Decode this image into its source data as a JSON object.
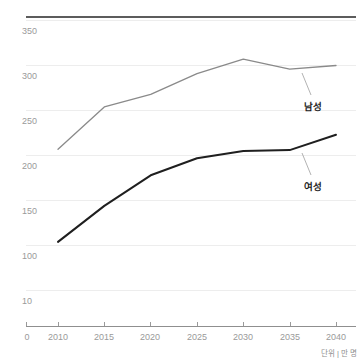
{
  "chart_data": {
    "type": "line",
    "title": "",
    "subtitle": "",
    "xlabel": "",
    "ylabel": "",
    "unit_note": "단위 | 만 명",
    "x": [
      2010,
      2015,
      2020,
      2025,
      2030,
      2035,
      2040
    ],
    "x_tick_labels": [
      "2010",
      "2015",
      "2020",
      "2025",
      "2030",
      "2035",
      "2040"
    ],
    "x_origin_label": "0",
    "y_tick_labels": [
      "10",
      "100",
      "150",
      "200",
      "250",
      "300",
      "350"
    ],
    "y_tick_values": [
      50,
      100,
      150,
      200,
      250,
      300,
      350
    ],
    "ylim": [
      0,
      375
    ],
    "xlim": [
      2006,
      2043
    ],
    "grid": true,
    "legend_position": "inline-annotation",
    "series": [
      {
        "name": "남성",
        "label": "남성",
        "color": "#8a8a8a",
        "values": [
          207,
          254,
          268,
          291,
          307,
          296,
          300
        ],
        "annotation_year": 2037
      },
      {
        "name": "여성",
        "label": "여성",
        "color": "#1f1f1f",
        "values": [
          104,
          144,
          178,
          197,
          205,
          206,
          223
        ],
        "annotation_year": 2037
      }
    ]
  },
  "labels": {
    "y_0": "350",
    "y_1": "300",
    "y_2": "250",
    "y_3": "200",
    "y_4": "150",
    "y_5": "100",
    "y_6": "10",
    "x_origin": "0",
    "x_0": "2010",
    "x_1": "2015",
    "x_2": "2020",
    "x_3": "2025",
    "x_4": "2030",
    "x_5": "2035",
    "x_6": "2040",
    "series_male": "남성",
    "series_female": "여성",
    "unit": "단위 | 만 명"
  }
}
